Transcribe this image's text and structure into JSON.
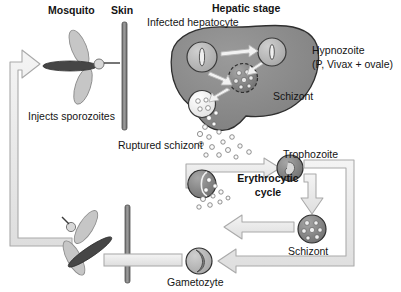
{
  "diagram": {
    "background": "#ffffff"
  },
  "labels": {
    "mosquito": "Mosquito",
    "skin": "Skin",
    "hepatic_stage": "Hepatic stage",
    "infected_hepatocyte": "Infected hepatocyte",
    "hypnozoite": "Hypnozoite",
    "hypnozoite_species": "(P, Vivax + ovale)",
    "schizont_liver": "Schizont",
    "injects_sporozoites": "Injects sporozoites",
    "ruptured_schizont": "Ruptured schizont",
    "trophozoite": "Trophozoite",
    "erythrocytic_cycle_line1": "Erythrocytic",
    "erythrocytic_cycle_line2": "cycle",
    "schizont_blood": "Schizont",
    "gametocyte": "Gametozyte"
  },
  "colors": {
    "liver_fill": "#8c8c8c",
    "liver_stroke": "#2b2b2b",
    "cell_light": "#b9b9b9",
    "cell_mid": "#9a9a9a",
    "cell_dark": "#7a7a7a",
    "cell_white": "#f2f2f2",
    "arrow_fill": "#e8e8e8",
    "arrow_stroke": "#9b9b9b",
    "white_arrow_fill": "#f0f0f0",
    "white_arrow_stroke": "#cfcfcf",
    "mosquito_body": "#4a4a4a",
    "mosquito_wing": "#c2c2c2",
    "skin_bar": "#8a8a8a",
    "text": "#141414"
  },
  "stages": [
    {
      "name": "mosquito-bite",
      "label": "Mosquito"
    },
    {
      "name": "skin-barrier",
      "label": "Skin"
    },
    {
      "name": "infected-hepatocyte",
      "label": "Infected hepatocyte"
    },
    {
      "name": "hypnozoite",
      "label": "Hypnozoite"
    },
    {
      "name": "liver-schizont",
      "label": "Schizont"
    },
    {
      "name": "ruptured-liver-schizont",
      "label": "Ruptured schizont"
    },
    {
      "name": "trophozoite",
      "label": "Trophozoite"
    },
    {
      "name": "blood-schizont",
      "label": "Schizont"
    },
    {
      "name": "gametocyte",
      "label": "Gametozyte"
    }
  ]
}
